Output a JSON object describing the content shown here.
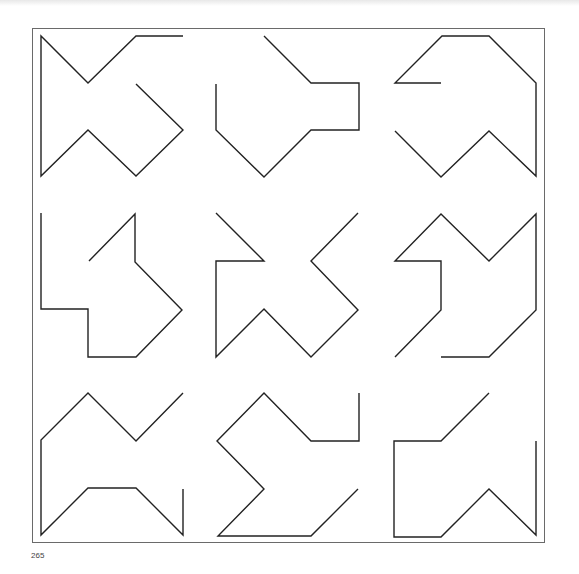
{
  "page": {
    "page_number": "265",
    "stroke_color": "#222222",
    "frame_color": "#6a6a6a"
  },
  "grid": {
    "rows": 3,
    "cols": 3,
    "figures": [
      {
        "name": "figure-r1c1",
        "points": "183,36 136,36 88,83 41,36 41,176 88,130 136,176 183,130 136,84"
      },
      {
        "name": "figure-r1c2",
        "points": "264,36 311,83 359,83 359,130 311,130 264,177 216,130 216,84"
      },
      {
        "name": "figure-r1c3",
        "points": "441,83 395,83 442,36 489,36 536,83 536,176 489,131 441,177 395,131"
      },
      {
        "name": "figure-r2c1",
        "points": "41,213 41,309 88,309 88,357 136,357 182,310 135,262 135,214 89,261"
      },
      {
        "name": "figure-r2c2",
        "points": "216,213 264,261 216,261 216,357 264,309 311,357 358,310 311,261 358,213"
      },
      {
        "name": "figure-r2c3",
        "points": "395,357 441,310 441,261 395,261 441,214 489,261 536,214 536,310 489,357 441,357"
      },
      {
        "name": "figure-r3c1",
        "points": "183,393 136,441 88,393 41,440 41,535 88,488 136,488 183,535 183,489"
      },
      {
        "name": "figure-r3c2",
        "points": "359,393 359,441 311,441 264,393 217,441 264,489 218,536 311,536 358,489"
      },
      {
        "name": "figure-r3c3",
        "points": "489,393 441,441 394,441 394,537 441,537 489,489 536,535 536,441"
      }
    ]
  }
}
